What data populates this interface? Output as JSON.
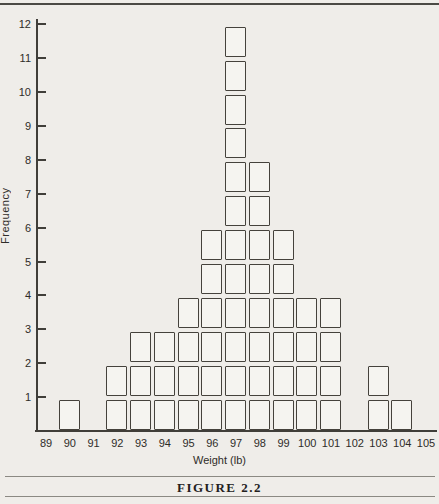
{
  "page": {
    "background": "#efede9",
    "caption": "FIGURE 2.2"
  },
  "chart_data": {
    "type": "bar",
    "variant": "unit-block-histogram",
    "title": "",
    "xlabel": "Weight (lb)",
    "ylabel": "Frequency",
    "xlim": [
      89,
      105
    ],
    "ylim": [
      0,
      12
    ],
    "grid": false,
    "legend": null,
    "categories": [
      89,
      90,
      91,
      92,
      93,
      94,
      95,
      96,
      97,
      98,
      99,
      100,
      101,
      102,
      103,
      104,
      105
    ],
    "values": [
      0,
      1,
      0,
      2,
      3,
      3,
      4,
      6,
      12,
      8,
      6,
      4,
      4,
      0,
      2,
      1,
      0
    ],
    "x_tick_labels": [
      "89",
      "90",
      "91",
      "92",
      "93",
      "94",
      "95",
      "96",
      "97",
      "98",
      "99",
      "100",
      "101",
      "102",
      "103",
      "104",
      "105"
    ],
    "y_tick_labels": [
      "1",
      "2",
      "3",
      "4",
      "5",
      "6",
      "7",
      "8",
      "9",
      "10",
      "11",
      "12"
    ],
    "ink_color": "#403e39",
    "block_fill": "#f5f4f0"
  }
}
